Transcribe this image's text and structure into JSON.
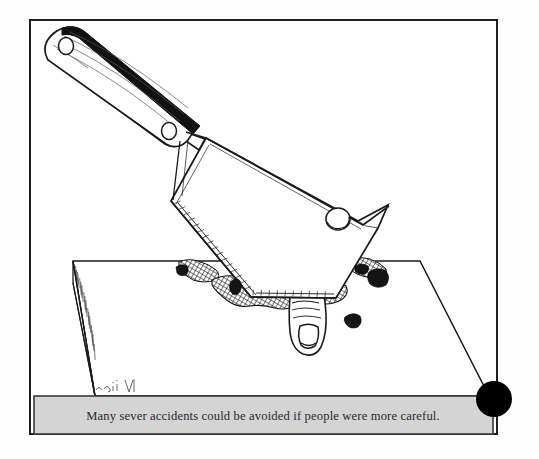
{
  "page": {
    "type": "cartoon-illustration",
    "background_color": "#fdfdfd",
    "ink_color": "#1a1a1a",
    "caption_background": "#d4d4d4",
    "caption_border_color": "#3a3a3a",
    "frame_border_color": "#1f1f1f"
  },
  "frame": {
    "name": "cartoon-frame",
    "x": 30,
    "y": 20,
    "width": 467,
    "height": 414
  },
  "caption": {
    "text": "Many sever accidents could be avoided if people were more careful.",
    "x": 34,
    "y": 396,
    "width": 459,
    "height": 38,
    "font_size": 12.6,
    "align": "center"
  },
  "scene": {
    "title": "Meat cleaver chopping down on a finger atop a cutting board",
    "objects": [
      {
        "name": "cleaver-handle",
        "label": "Wooden cleaver handle with two rivets",
        "rivet_count": 2,
        "fill": "#ffffff",
        "spine_fill": "#111111"
      },
      {
        "name": "cleaver-blade",
        "label": "Large rectangular cleaver blade",
        "fill": "#ffffff",
        "has_hanging_hole": true
      },
      {
        "name": "hanging-hole",
        "label": "Round hanging hole near blade spine",
        "cx": 338,
        "cy": 219,
        "r": 11
      },
      {
        "name": "blade-edge-hatching",
        "label": "Tick-mark hatching along the sharpened edge"
      },
      {
        "name": "cutting-board",
        "label": "Wooden cutting board in perspective",
        "fill": "#ffffff",
        "edge_hatching": true
      },
      {
        "name": "severed-finger",
        "label": "Severed finger with fingernail below blade",
        "fill": "#ffffff"
      },
      {
        "name": "blood-pool",
        "label": "Cross-hatched blood pools under the blade edge",
        "count": 3
      },
      {
        "name": "debris-fragments",
        "label": "Scattered dark flesh fragments on board",
        "count": 5
      },
      {
        "name": "artist-signature",
        "label": "Small artist signature mark at lower-left of board",
        "x": 95,
        "y": 388
      },
      {
        "name": "black-dot",
        "label": "Solid black circle overlapping bottom-right corner",
        "cx": 494,
        "cy": 399,
        "r": 18,
        "fill": "#000000"
      }
    ]
  }
}
